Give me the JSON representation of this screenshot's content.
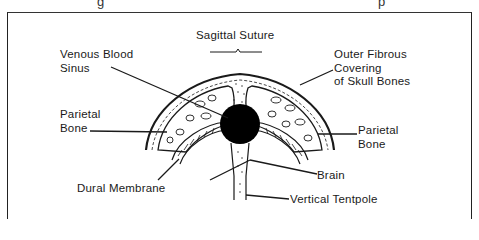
{
  "figure": {
    "top_cutoff_fragments": [
      "g",
      "p"
    ],
    "labels": {
      "sagittal_suture": "Sagittal Suture",
      "venous_blood_sinus_line1": "Venous Blood",
      "venous_blood_sinus_line2": "Sinus",
      "outer_fibrous_line1": "Outer Fibrous",
      "outer_fibrous_line2": "Covering",
      "outer_fibrous_line3": "of Skull Bones",
      "parietal_left_line1": "Parietal",
      "parietal_left_line2": "Bone",
      "parietal_right_line1": "Parietal",
      "parietal_right_line2": "Bone",
      "dural_membrane": "Dural Membrane",
      "brain": "Brain",
      "vertical_tentpole": "Vertical Tentpole"
    },
    "colors": {
      "ink": "#1a1a1a",
      "background": "#ffffff",
      "sinus_fill": "#000000"
    }
  }
}
